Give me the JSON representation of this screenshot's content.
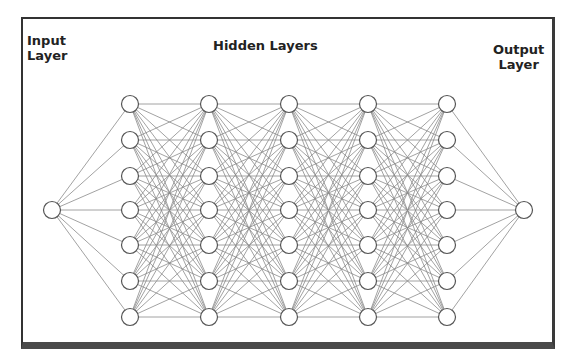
{
  "diagram": {
    "type": "neural-network",
    "labels": {
      "input": [
        "Input",
        "Layer"
      ],
      "hidden": "Hidden Layers",
      "output": [
        "Output",
        "Layer"
      ]
    },
    "layers": [
      {
        "name": "input",
        "x": 52,
        "nodes": 1
      },
      {
        "name": "hidden-1",
        "x": 130,
        "nodes": 7
      },
      {
        "name": "hidden-2",
        "x": 209,
        "nodes": 7
      },
      {
        "name": "hidden-3",
        "x": 289,
        "nodes": 7
      },
      {
        "name": "hidden-4",
        "x": 368,
        "nodes": 7
      },
      {
        "name": "hidden-5",
        "x": 447,
        "nodes": 7
      },
      {
        "name": "output",
        "x": 524,
        "nodes": 1
      }
    ],
    "hidden_rows_y": [
      104,
      140,
      176,
      210,
      245,
      281,
      317
    ],
    "single_node_y": 210,
    "node_radius": 8.5,
    "connectivity": "fully-connected",
    "colors": {
      "edge": "#8a8a8a",
      "node_stroke": "#555555",
      "frame": "#333333"
    }
  }
}
